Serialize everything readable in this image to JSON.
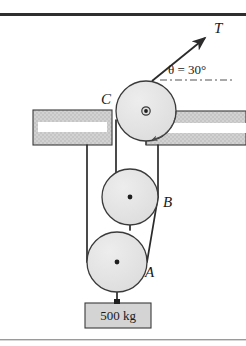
{
  "figure": {
    "type": "physics-free-body-diagram",
    "width": 246,
    "height": 346
  },
  "labels": {
    "tension": "T",
    "angle": "θ = 30°",
    "pulley_a": "A",
    "pulley_b": "B",
    "pulley_c": "C",
    "mass": "500 kg"
  },
  "colors": {
    "outline": "#3a3a3a",
    "pulley_fill": "#e3e3e3",
    "wall_fill": "#cfcfcf",
    "wall_hatch": "#b6b6b6",
    "mass_fill": "#d4d4d4",
    "rope": "#2b2b2b",
    "rule": "#2e2e2e",
    "bottom_rule": "#9a9a9a",
    "background": "#ffffff"
  },
  "geometry": {
    "pulley_a": {
      "cx": 117,
      "cy": 262,
      "r": 30
    },
    "pulley_b": {
      "cx": 130,
      "cy": 197,
      "r": 28
    },
    "pulley_c": {
      "cx": 146,
      "cy": 111,
      "r": 30
    },
    "mass_block": {
      "x": 85,
      "y": 303,
      "w": 66,
      "h": 25
    },
    "left_bracket": {
      "x": 33,
      "y": 110,
      "w": 79,
      "h": 35
    },
    "right_bracket": {
      "x": 145,
      "y": 111,
      "w": 101,
      "h": 34
    },
    "tension_arrow": {
      "x1": 152,
      "y1": 80,
      "x2": 205,
      "y2": 37
    },
    "angle_ref_line": {
      "x1": 152,
      "y1": 80,
      "x2": 232,
      "y2": 80
    }
  },
  "annotations": {
    "arc_angle_deg": 30,
    "mass_value": 500,
    "mass_unit": "kg"
  }
}
